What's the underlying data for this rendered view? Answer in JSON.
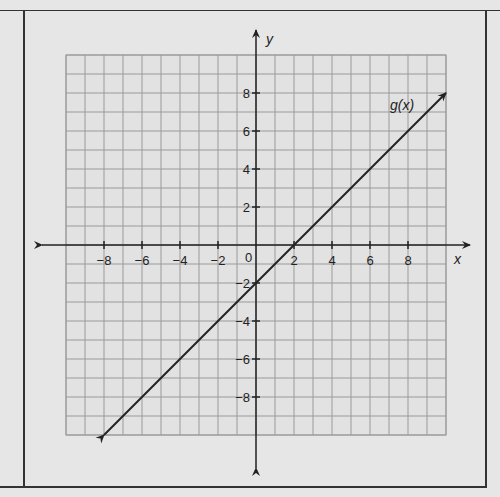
{
  "chart_data": {
    "type": "line",
    "title": "",
    "xlabel": "x",
    "ylabel": "y",
    "xlim": [
      -10,
      10
    ],
    "ylim": [
      -10,
      10
    ],
    "grid": true,
    "x_ticks": [
      -8,
      -6,
      -4,
      -2,
      2,
      4,
      6,
      8
    ],
    "y_ticks": [
      8,
      6,
      4,
      2,
      -2,
      -4,
      -6,
      -8
    ],
    "origin_label": "0",
    "series": [
      {
        "name": "g(x)",
        "equation": "g(x) = x - 2",
        "x": [
          -8,
          -6,
          -4,
          -2,
          0,
          2,
          4,
          6,
          8,
          10
        ],
        "values": [
          -10,
          -8,
          -6,
          -4,
          -2,
          0,
          2,
          4,
          6,
          8
        ],
        "arrows_both_ends": true
      }
    ],
    "annotations": [
      {
        "text": "g(x)",
        "x": 7.5,
        "y": 7.3
      }
    ]
  },
  "labels": {
    "x_axis": "x",
    "y_axis": "y",
    "origin": "0",
    "line": "g(x)",
    "xt": [
      "-8",
      "-6",
      "-4",
      "-2",
      "2",
      "4",
      "6",
      "8"
    ],
    "yt": [
      "8",
      "6",
      "4",
      "2",
      "-2",
      "-4",
      "-6",
      "-8"
    ]
  }
}
